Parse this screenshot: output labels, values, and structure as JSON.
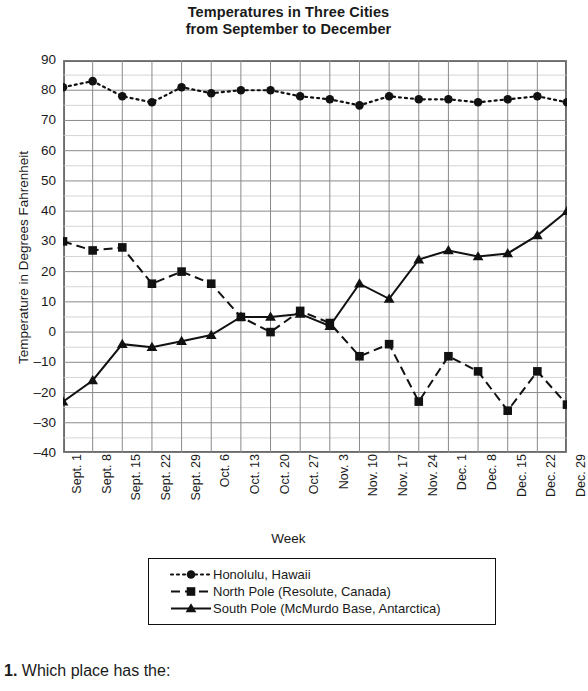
{
  "chart_title": {
    "line1": "Temperatures in Three Cities",
    "line2": "from September to December"
  },
  "axis": {
    "y_title": "Temperature in Degrees Fahrenheit",
    "x_title": "Week"
  },
  "question": {
    "number": "1.",
    "text": "Which place has the:"
  },
  "colors": {
    "ink": "#111111",
    "frame": "#6b6b6b",
    "major_grid": "#8a8a8a",
    "minor_grid": "#c9c9c9",
    "background": "#ffffff"
  },
  "chart_data": {
    "type": "line",
    "title": "Temperatures in Three Cities from September to December",
    "xlabel": "Week",
    "ylabel": "Temperature in Degrees Fahrenheit",
    "ylim": [
      -40,
      90
    ],
    "ytick_step": 10,
    "yminor_step": 5,
    "grid": true,
    "legend_position": "bottom",
    "ytick_labels": [
      "90",
      "80",
      "70",
      "60",
      "50",
      "40",
      "30",
      "20",
      "10",
      "0",
      "-10",
      "-20",
      "-30",
      "-40"
    ],
    "ytick_values": [
      90,
      80,
      70,
      60,
      50,
      40,
      30,
      20,
      10,
      0,
      -10,
      -20,
      -30,
      -40
    ],
    "categories": [
      "Sept. 1",
      "Sept. 8",
      "Sept. 15",
      "Sept. 22",
      "Sept. 29",
      "Oct. 6",
      "Oct. 13",
      "Oct. 20",
      "Oct. 27",
      "Nov. 3",
      "Nov. 10",
      "Nov. 17",
      "Nov. 24",
      "Dec. 1",
      "Dec. 8",
      "Dec. 15",
      "Dec. 22",
      "Dec. 29"
    ],
    "series": [
      {
        "name": "Honolulu, Hawaii",
        "marker": "circle",
        "line_style": "dotted",
        "values": [
          81,
          83,
          78,
          76,
          81,
          79,
          80,
          80,
          78,
          77,
          75,
          78,
          77,
          77,
          76,
          77,
          78,
          76
        ]
      },
      {
        "name": "North Pole (Resolute, Canada)",
        "marker": "square",
        "line_style": "dashed",
        "values": [
          30,
          27,
          28,
          16,
          20,
          16,
          5,
          0,
          7,
          3,
          -8,
          -4,
          -23,
          -8,
          -13,
          -26,
          -13,
          -24
        ]
      },
      {
        "name": "South Pole (McMurdo Base, Antarctica)",
        "marker": "triangle",
        "line_style": "solid",
        "values": [
          -23,
          -16,
          -4,
          -5,
          -3,
          -1,
          5,
          5,
          6,
          2,
          16,
          11,
          24,
          27,
          25,
          26,
          32,
          40
        ]
      }
    ]
  }
}
